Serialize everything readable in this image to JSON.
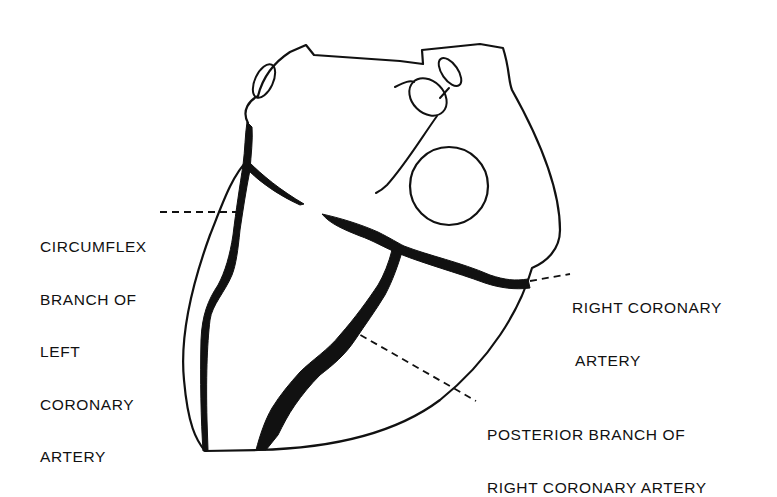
{
  "figure": {
    "colors": {
      "ink": "#111111",
      "background": "#ffffff"
    }
  },
  "labels": {
    "circumflex": {
      "lines": [
        "CIRCUMFLEX",
        "BRANCH OF",
        "LEFT",
        "CORONARY",
        "ARTERY"
      ]
    },
    "right_coronary": {
      "lines": [
        "RIGHT CORONARY",
        "ARTERY"
      ]
    },
    "posterior_branch": {
      "lines": [
        "POSTERIOR BRANCH OF",
        "RIGHT CORONARY ARTERY"
      ]
    }
  }
}
